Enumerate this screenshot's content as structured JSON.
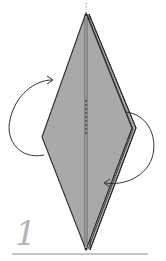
{
  "diagram": {
    "type": "origami-fold-step",
    "step_number": "1",
    "colors": {
      "paper_fill": "#a9a9a9",
      "outline": "#2a2a2a",
      "arrow": "#333333",
      "step_number": "#b5b5b5",
      "baseline": "#8a8a8a",
      "background": "#ffffff"
    },
    "arrows": [
      {
        "name": "left-fold-arrow",
        "direction": "clockwise-up-right",
        "meaning": "fold behind / turn flap"
      },
      {
        "name": "right-fold-arrow",
        "direction": "counterclockwise-down-left",
        "meaning": "fold flap to the left"
      }
    ]
  }
}
